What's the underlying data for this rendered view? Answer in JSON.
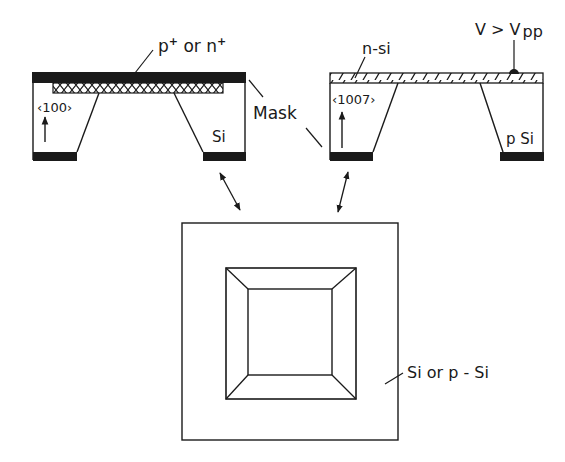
{
  "figure": {
    "left_section": {
      "top_label": "p",
      "top_label_sup1": "+",
      "top_label_or": " or n",
      "top_label_sup2": "+",
      "orientation_label": "‹100›",
      "substrate_label": "Si"
    },
    "right_section": {
      "layer_label": "n-si",
      "voltage_label": "V > V",
      "voltage_sub": "pp",
      "orientation_label": "‹1007›",
      "substrate_label": "p Si"
    },
    "mask_label": "Mask",
    "top_view": {
      "material_label": "Si or p - Si"
    },
    "colors": {
      "ink": "#1a1a1a",
      "background": "#ffffff"
    }
  }
}
